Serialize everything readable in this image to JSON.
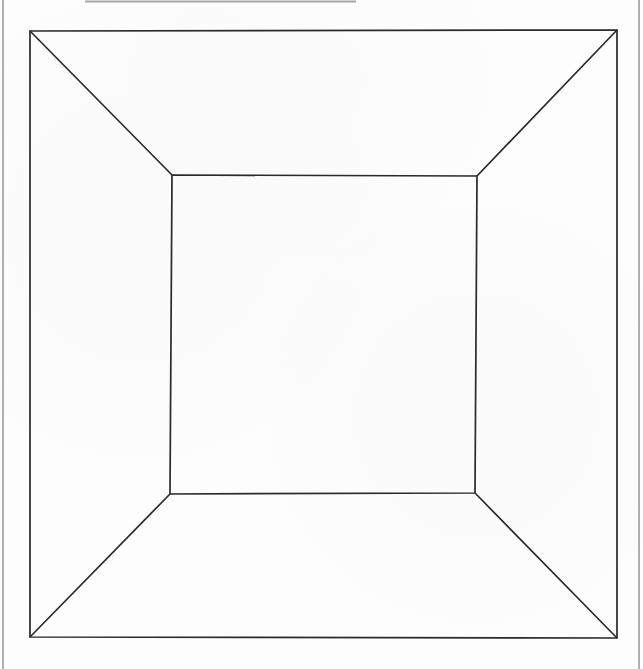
{
  "page": {
    "width": 643,
    "height": 669,
    "background_color": "#fdfdfd",
    "stroke_color": "#2a2a2a",
    "edge_color": "#8a8a8a"
  },
  "scan_edges": {
    "left_rule": {
      "x1": 3,
      "y1": 0,
      "x2": 3,
      "y2": 669,
      "color": "#8e8e8e",
      "width": 1.4
    },
    "right_rule": {
      "x1": 639,
      "y1": 0,
      "x2": 639,
      "y2": 669,
      "color": "#8e8e8e",
      "width": 1.4
    },
    "top_rule": {
      "x1": 85,
      "y1": 1.5,
      "x2": 356,
      "y2": 1.5,
      "color": "#a8a8a8",
      "width": 2
    }
  },
  "drawing": {
    "type": "one-point-perspective-box",
    "description": "Nested rectangles joined corner to corner by four diagonals",
    "stroke_width": 1.7,
    "outer_rect": {
      "name": "outer-rectangle",
      "points": "30,31 617,30 617,638 30,637",
      "corners": {
        "top_left": [
          30,
          31
        ],
        "top_right": [
          617,
          30
        ],
        "bottom_right": [
          617,
          638
        ],
        "bottom_left": [
          30,
          637
        ]
      }
    },
    "inner_rect": {
      "name": "inner-rectangle",
      "points": "172,175 477,176 475,493 170,494",
      "corners": {
        "top_left": [
          172,
          175
        ],
        "top_right": [
          477,
          176
        ],
        "bottom_right": [
          475,
          493
        ],
        "bottom_left": [
          170,
          494
        ]
      }
    },
    "diagonals": [
      {
        "name": "diagonal-top-left",
        "x1": 30,
        "y1": 31,
        "x2": 172,
        "y2": 175
      },
      {
        "name": "diagonal-top-right",
        "x1": 617,
        "y1": 30,
        "x2": 477,
        "y2": 176
      },
      {
        "name": "diagonal-bottom-right",
        "x1": 617,
        "y1": 638,
        "x2": 475,
        "y2": 493
      },
      {
        "name": "diagonal-bottom-left",
        "x1": 30,
        "y1": 637,
        "x2": 170,
        "y2": 494
      }
    ]
  }
}
